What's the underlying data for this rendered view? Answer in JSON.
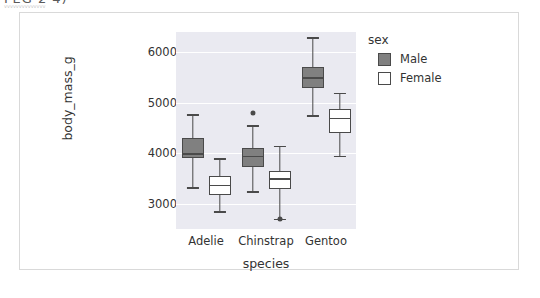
{
  "header": {
    "clipped_text": "FEG 2 4)",
    "clipped_subtext": "vvvvvvvvvvvvvv"
  },
  "legend": {
    "title": "sex",
    "entries": [
      {
        "label": "Male",
        "color": "#808080"
      },
      {
        "label": "Female",
        "color": "#ffffff"
      }
    ]
  },
  "chart_data": {
    "type": "box",
    "title": "",
    "xlabel": "species",
    "ylabel": "body_mass_g",
    "categories": [
      "Adelie",
      "Chinstrap",
      "Gentoo"
    ],
    "ylim": [
      2500,
      6400
    ],
    "yticks": [
      3000,
      4000,
      5000,
      6000
    ],
    "ytick_labels": [
      "3000",
      "4000",
      "5000",
      "6000"
    ],
    "grid": "horizontal-white",
    "plot_background": "#eaeaf1",
    "legend_position": "right",
    "hue": "sex",
    "hue_order": [
      "Male",
      "Female"
    ],
    "series": [
      {
        "name": "Male",
        "color": "#808080",
        "boxes": [
          {
            "category": "Adelie",
            "whisker_low": 3325,
            "q1": 3900,
            "median": 4000,
            "q3": 4300,
            "whisker_high": 4775,
            "outliers": []
          },
          {
            "category": "Chinstrap",
            "whisker_low": 3250,
            "q1": 3731,
            "median": 3950,
            "q3": 4100,
            "whisker_high": 4550,
            "outliers": [
              4800
            ]
          },
          {
            "category": "Gentoo",
            "whisker_low": 4750,
            "q1": 5300,
            "median": 5500,
            "q3": 5700,
            "whisker_high": 6300,
            "outliers": []
          }
        ]
      },
      {
        "name": "Female",
        "color": "#ffffff",
        "boxes": [
          {
            "category": "Adelie",
            "whisker_low": 2850,
            "q1": 3175,
            "median": 3375,
            "q3": 3550,
            "whisker_high": 3900,
            "outliers": []
          },
          {
            "category": "Chinstrap",
            "whisker_low": 2700,
            "q1": 3300,
            "median": 3500,
            "q3": 3650,
            "whisker_high": 4150,
            "outliers": [
              2700
            ]
          },
          {
            "category": "Gentoo",
            "whisker_low": 3950,
            "q1": 4400,
            "median": 4700,
            "q3": 4875,
            "whisker_high": 5200,
            "outliers": []
          }
        ]
      }
    ]
  }
}
